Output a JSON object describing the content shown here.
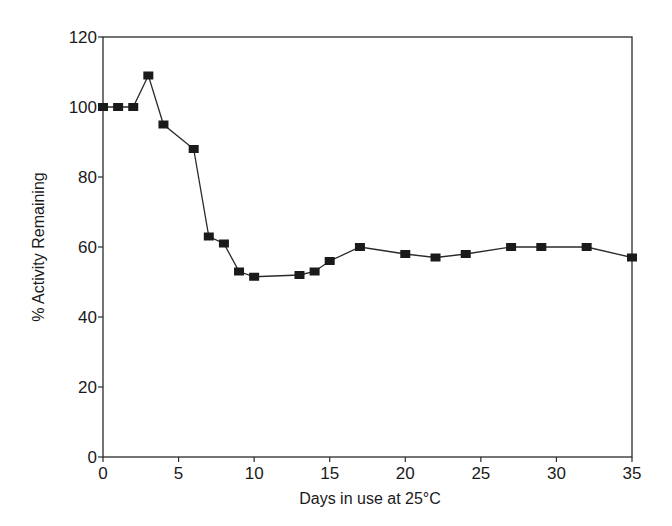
{
  "chart_data": {
    "type": "line",
    "title": "",
    "xlabel": "Days in use at 25°C",
    "ylabel": "% Activity Remaining",
    "xlim": [
      0,
      35
    ],
    "ylim": [
      0,
      120
    ],
    "xticks": [
      0,
      5,
      10,
      15,
      20,
      25,
      30,
      35
    ],
    "yticks": [
      0,
      20,
      40,
      60,
      80,
      100,
      120
    ],
    "grid": false,
    "legend": null,
    "marker": "square",
    "series": [
      {
        "name": "% Activity Remaining",
        "x": [
          0,
          1,
          2,
          3,
          4,
          6,
          7,
          8,
          9,
          10,
          13,
          14,
          15,
          17,
          20,
          22,
          24,
          27,
          29,
          32,
          35
        ],
        "values": [
          100,
          100,
          100,
          109,
          95,
          88,
          63,
          61,
          53,
          51.5,
          52,
          53,
          56,
          60,
          58,
          57,
          58,
          60,
          60,
          60,
          57
        ]
      }
    ]
  },
  "colors": {
    "line": "#2a2a2a",
    "marker": "#1a1a1a",
    "axis": "#2a2a2a"
  }
}
